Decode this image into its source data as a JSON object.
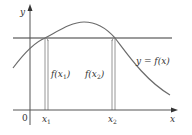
{
  "figure": {
    "type": "function-graph",
    "curve_label": "y = f(x)",
    "axes": {
      "y_label": "y",
      "x_label": "x",
      "origin_label": "0"
    },
    "points": [
      {
        "x_label": "x",
        "x_sub": "1",
        "value_label_prefix": "f(x",
        "value_label_sub": "1",
        "value_label_suffix": ")"
      },
      {
        "x_label": "x",
        "x_sub": "2",
        "value_label_prefix": "f(x",
        "value_label_sub": "2",
        "value_label_suffix": ")"
      }
    ],
    "colors": {
      "axis": "#555555",
      "curve": "#6b6b6b",
      "horizontal_line": "#7a7a7a",
      "vertical_bars": "#9a9a9a",
      "text": "#333333"
    }
  }
}
